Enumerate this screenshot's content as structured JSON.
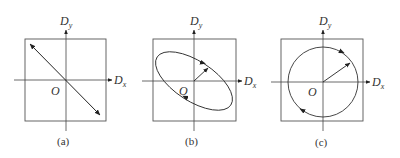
{
  "panels": [
    {
      "id": "a",
      "caption": "(a)",
      "origin_label": "O",
      "x_label": "D",
      "x_sub": "x",
      "y_label": "D",
      "y_sub": "y",
      "shape": "line",
      "description": "linear polarization: double-headed arrow along diagonal"
    },
    {
      "id": "b",
      "caption": "(b)",
      "origin_label": "O",
      "x_label": "D",
      "x_sub": "x",
      "y_label": "D",
      "y_sub": "y",
      "shape": "ellipse",
      "description": "elliptical polarization: tilted ellipse with clockwise arrows and radius vector"
    },
    {
      "id": "c",
      "caption": "(c)",
      "origin_label": "O",
      "x_label": "D",
      "x_sub": "x",
      "y_label": "D",
      "y_sub": "y",
      "shape": "circle",
      "description": "circular polarization: circle with clockwise arrows and radius vector"
    }
  ],
  "colors": {
    "stroke": "#3a3a3a",
    "text": "#333333"
  }
}
